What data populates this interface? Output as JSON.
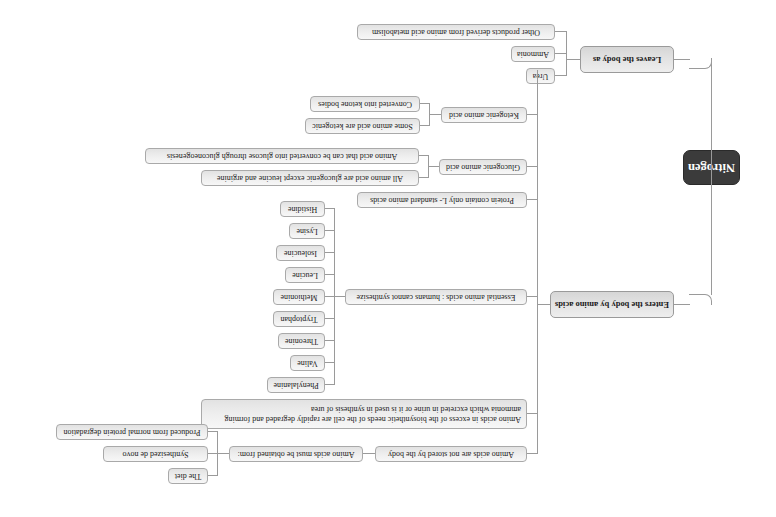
{
  "document": {
    "type": "mind-map",
    "orientation": "rotated-180",
    "background_color": "#ffffff",
    "root_color": "#3b3b3b",
    "node_fill": "#ededed",
    "node_border": "#a9a9a9",
    "connector_color": "#9a9a9a"
  },
  "root": {
    "label": "Nitrogen"
  },
  "branches": [
    {
      "id": "leaves",
      "label": "Leaves the body as",
      "children": [
        {
          "label": "Urea"
        },
        {
          "label": "Ammonia"
        },
        {
          "label": "Other products derived from amino acid metabolism"
        }
      ]
    },
    {
      "id": "enters",
      "label": "Enters the body by amino acids",
      "children": [
        {
          "label": "Ketogenic amino acid",
          "children": [
            {
              "label": "Some amino acid are ketogenic"
            },
            {
              "label": "Converted into ketone bodies"
            }
          ]
        },
        {
          "label": "Glucogenic amino acid",
          "children": [
            {
              "label": "All amino acid are glucogenic except leucine and arginine"
            },
            {
              "label": "Amino acid that can be converted into glucose through gluconeogenesis"
            }
          ]
        },
        {
          "label": "Protein contain only L- standard amino acids",
          "children": []
        },
        {
          "label": "Essential amino acids : humans cannot synthesize",
          "children": [
            {
              "label": "Histidine"
            },
            {
              "label": "Lysine"
            },
            {
              "label": "Isoleucine"
            },
            {
              "label": "Leucine"
            },
            {
              "label": "Methionine"
            },
            {
              "label": "Tryptophan"
            },
            {
              "label": "Threonine"
            },
            {
              "label": "Valine"
            },
            {
              "label": "Phenylalanine"
            }
          ]
        },
        {
          "label": "Amino acids in excess of the biosynthetic needs of the cell are rapidly degraded and forming ammonia which excreted in urine or it is used in synthesis of urea",
          "children": []
        },
        {
          "label": "Amino acids are not stored by the body",
          "children": [
            {
              "label": "Amino acids must be obtained from:",
              "children": [
                {
                  "label": "Produced from normal protein degradation"
                },
                {
                  "label": "Synthesized de novo"
                },
                {
                  "label": "The diet"
                }
              ]
            }
          ]
        }
      ]
    }
  ]
}
